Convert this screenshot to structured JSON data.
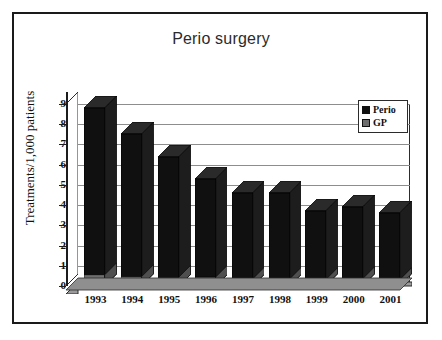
{
  "chart_data": {
    "type": "bar",
    "title": "Perio surgery",
    "xlabel": "",
    "ylabel": "Treatments/1,000 patients",
    "categories": [
      "1993",
      "1994",
      "1995",
      "1996",
      "1997",
      "1998",
      "1999",
      "2000",
      "2001"
    ],
    "series": [
      {
        "name": "Perio",
        "color": "#101010",
        "values": [
          8.8,
          7.5,
          6.4,
          5.3,
          4.6,
          4.6,
          3.7,
          3.9,
          3.6
        ]
      },
      {
        "name": "GP",
        "color": "#6e6e6e",
        "values": [
          0.55,
          0.45,
          0.45,
          0.45,
          0.35,
          0.35,
          0.3,
          0.35,
          0.3
        ]
      }
    ],
    "ylim": [
      0,
      9
    ],
    "yticks": [
      "0",
      "1",
      "2",
      "3",
      "4",
      "5",
      "6",
      "7",
      "8",
      "9"
    ],
    "grid": true,
    "legend_position": "top-right",
    "style": "3d-column"
  },
  "legend": {
    "items": [
      {
        "label": "Perio",
        "color": "#101010"
      },
      {
        "label": "GP",
        "color": "#6e6e6e"
      }
    ]
  }
}
